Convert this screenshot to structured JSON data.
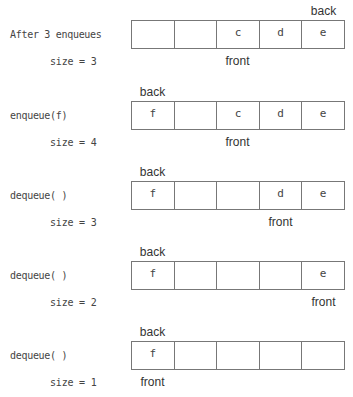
{
  "diagram": {
    "pointer_labels": {
      "back": "back",
      "front": "front"
    },
    "rows": [
      {
        "operation": "After 3 enqueues",
        "size_text": "size = 3",
        "cells": [
          "",
          "",
          "c",
          "d",
          "e"
        ],
        "back_index": 4,
        "front_index": 2
      },
      {
        "operation": "enqueue(f)",
        "size_text": "size = 4",
        "cells": [
          "f",
          "",
          "c",
          "d",
          "e"
        ],
        "back_index": 0,
        "front_index": 2
      },
      {
        "operation": "dequeue( )",
        "size_text": "size = 3",
        "cells": [
          "f",
          "",
          "",
          "d",
          "e"
        ],
        "back_index": 0,
        "front_index": 3
      },
      {
        "operation": "dequeue( )",
        "size_text": "size = 2",
        "cells": [
          "f",
          "",
          "",
          "",
          "e"
        ],
        "back_index": 0,
        "front_index": 4
      },
      {
        "operation": "dequeue( )",
        "size_text": "size = 1",
        "cells": [
          "f",
          "",
          "",
          "",
          ""
        ],
        "back_index": 0,
        "front_index": 0
      }
    ]
  }
}
